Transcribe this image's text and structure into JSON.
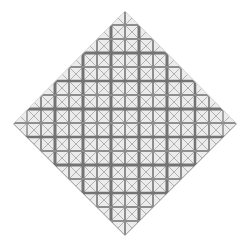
{
  "artwork": {
    "shape": "diamond",
    "vertices": {
      "top": [
        125,
        11
      ],
      "right": [
        237,
        124
      ],
      "bottom": [
        125,
        236
      ],
      "left": [
        13,
        124
      ]
    },
    "cell_size": 14,
    "grid_origin": [
      13,
      11
    ],
    "grid_count": 16,
    "colors": {
      "background": "#ffffff",
      "canvas": "#ececec",
      "line": "#8e8e8e",
      "thick_line": "#737373",
      "diagonal": "#a2a2a2"
    },
    "vertical_lines": [
      {
        "x": 27,
        "w": 1.5
      },
      {
        "x": 41,
        "w": 2
      },
      {
        "x": 55,
        "w": 3
      },
      {
        "x": 69,
        "w": 2
      },
      {
        "x": 83,
        "w": 3
      },
      {
        "x": 97,
        "w": 2
      },
      {
        "x": 111,
        "w": 3
      },
      {
        "x": 125,
        "w": 2
      },
      {
        "x": 139,
        "w": 3
      },
      {
        "x": 153,
        "w": 2
      },
      {
        "x": 167,
        "w": 3
      },
      {
        "x": 181,
        "w": 2
      },
      {
        "x": 195,
        "w": 2.5
      },
      {
        "x": 209,
        "w": 2
      },
      {
        "x": 223,
        "w": 1.5
      }
    ],
    "horizontal_lines": [
      {
        "y": 25,
        "w": 2
      },
      {
        "y": 39,
        "w": 2
      },
      {
        "y": 53,
        "w": 3
      },
      {
        "y": 67,
        "w": 2
      },
      {
        "y": 81,
        "w": 2.5
      },
      {
        "y": 95,
        "w": 2
      },
      {
        "y": 109,
        "w": 3
      },
      {
        "y": 123,
        "w": 2
      },
      {
        "y": 137,
        "w": 2.5
      },
      {
        "y": 151,
        "w": 2
      },
      {
        "y": 165,
        "w": 3
      },
      {
        "y": 179,
        "w": 2
      },
      {
        "y": 193,
        "w": 2.5
      },
      {
        "y": 207,
        "w": 2
      },
      {
        "y": 221,
        "w": 2
      }
    ]
  }
}
